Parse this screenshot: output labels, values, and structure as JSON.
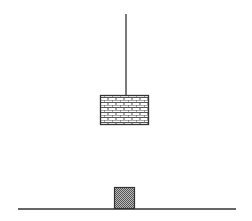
{
  "diagram": {
    "colors": {
      "line": "#333333",
      "background": "#ffffff",
      "brick_fill": "#ffffff",
      "mortar": "#555555",
      "box_fill": "#888888"
    },
    "string": {
      "x": 126,
      "y1": 14,
      "y2": 96
    },
    "hanging_block": {
      "x": 100,
      "y": 95,
      "width": 49,
      "height": 30,
      "pattern": "brick"
    },
    "ground": {
      "x1": 18,
      "x2": 236,
      "y": 209
    },
    "small_box": {
      "x": 114,
      "y": 187,
      "width": 21,
      "height": 22,
      "pattern": "checker"
    }
  }
}
